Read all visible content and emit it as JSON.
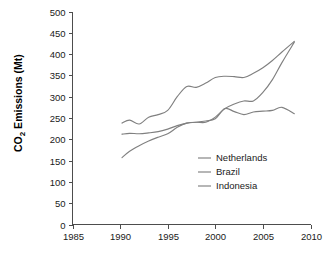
{
  "chart_data": {
    "type": "line",
    "title": "",
    "xlabel": "",
    "ylabel": "CO2 Emissions (Mt)",
    "ylabel_display": "Emissions (Mt)",
    "ylabel_prefix": "CO",
    "ylabel_subscript": "2",
    "xlim": [
      1985,
      2010
    ],
    "ylim": [
      0,
      500
    ],
    "grid": false,
    "legend_position": "inside-lower-right",
    "xticks": [
      1985,
      1990,
      1995,
      2000,
      2005,
      2010
    ],
    "xtick_labels": [
      "1985",
      "1990",
      "1995",
      "2000",
      "2005",
      "2010"
    ],
    "yticks": [
      0,
      50,
      100,
      150,
      200,
      250,
      300,
      350,
      400,
      450,
      500
    ],
    "ytick_labels": [
      "0",
      "50",
      "100",
      "150",
      "200",
      "250",
      "300",
      "350",
      "400",
      "450",
      "500"
    ],
    "line_color": "#808080",
    "axis_color": "#4d4d4d",
    "background_color": "#ffffff",
    "series": [
      {
        "name": "Netherlands",
        "color": "#808080",
        "x": [
          1990.2,
          1991,
          1992,
          1993,
          1994,
          1995,
          1996,
          1997,
          1998,
          1999,
          2000,
          2001,
          2002,
          2003,
          2004,
          2005,
          2006,
          2007,
          2008.3
        ],
        "values": [
          238,
          245,
          236,
          252,
          258,
          268,
          300,
          324,
          322,
          332,
          345,
          348,
          347,
          345,
          355,
          368,
          385,
          405,
          430
        ]
      },
      {
        "name": "Brazil",
        "color": "#808080",
        "x": [
          1990.2,
          1991,
          1992,
          1993,
          1994,
          1995,
          1996,
          1997,
          1998,
          1999,
          2000,
          2001,
          2002,
          2003,
          2004,
          2005,
          2006,
          2007,
          2008.3
        ],
        "values": [
          212,
          214,
          213,
          215,
          218,
          224,
          232,
          238,
          240,
          240,
          252,
          272,
          283,
          290,
          290,
          310,
          340,
          380,
          428
        ]
      },
      {
        "name": "Indonesia",
        "color": "#808080",
        "x": [
          1990.2,
          1991,
          1992,
          1993,
          1994,
          1995,
          1996,
          1997,
          1998,
          1999,
          2000,
          2001,
          2002,
          2003,
          2004,
          2005,
          2006,
          2007,
          2008.3
        ],
        "values": [
          157,
          172,
          185,
          196,
          205,
          213,
          228,
          238,
          240,
          243,
          248,
          272,
          265,
          258,
          264,
          266,
          268,
          275,
          260
        ]
      }
    ]
  },
  "legend": {
    "items": [
      {
        "label": "Netherlands"
      },
      {
        "label": "Brazil"
      },
      {
        "label": "Indonesia"
      }
    ]
  }
}
